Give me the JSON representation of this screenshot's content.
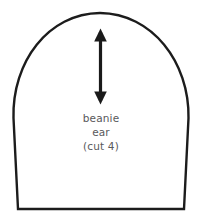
{
  "canvas": {
    "width": 202,
    "height": 217,
    "background_color": "#ffffff"
  },
  "pattern_piece": {
    "shape_name": "dome-arch-pattern-piece",
    "outline_color": "#1c1c1c",
    "fill_color": "#ffffff",
    "outline_width": 2.4,
    "geometry": {
      "apex_x": 100,
      "apex_y": 13,
      "left_extreme_x": 13,
      "right_extreme_x": 189,
      "widest_y": 100,
      "bottom_y": 209,
      "bottom_left_x": 18,
      "bottom_right_x": 184
    }
  },
  "grainline_arrow": {
    "icon": "double-headed-vertical-arrow",
    "color": "#1a1a1a",
    "center_x": 100,
    "top_y": 29,
    "bottom_y": 104,
    "shaft_width": 3.2,
    "head_width": 13,
    "head_height": 13
  },
  "labels": {
    "line_1": "beanie",
    "line_2": "ear",
    "line_3": "(cut 4)",
    "text_color": "#59595b",
    "font_size_px": 10.5
  }
}
